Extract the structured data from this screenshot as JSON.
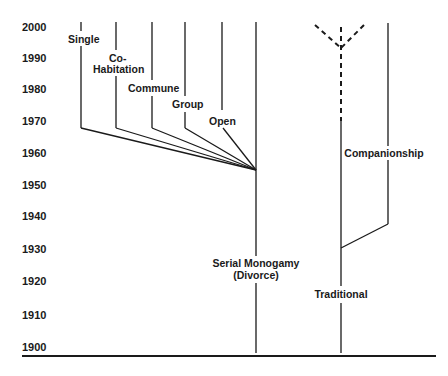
{
  "diagram": {
    "type": "timeline-branching",
    "y_axis": {
      "ticks": [
        {
          "label": "2000",
          "y": 27
        },
        {
          "label": "1990",
          "y": 58
        },
        {
          "label": "1980",
          "y": 89
        },
        {
          "label": "1970",
          "y": 121
        },
        {
          "label": "1960",
          "y": 153
        },
        {
          "label": "1950",
          "y": 185
        },
        {
          "label": "1940",
          "y": 216
        },
        {
          "label": "1930",
          "y": 249
        },
        {
          "label": "1920",
          "y": 281
        },
        {
          "label": "1910",
          "y": 315
        },
        {
          "label": "1900",
          "y": 347
        }
      ]
    },
    "branches": {
      "single": "Single",
      "cohabitation_line1": "Co-",
      "cohabitation_line2": "Habitation",
      "commune": "Commune",
      "group": "Group",
      "open": "Open",
      "serial_line1": "Serial Monogamy",
      "serial_line2": "(Divorce)",
      "companionship": "Companionship",
      "traditional": "Traditional"
    },
    "colors": {
      "ink": "#1a1a1a",
      "background": "#ffffff"
    }
  }
}
